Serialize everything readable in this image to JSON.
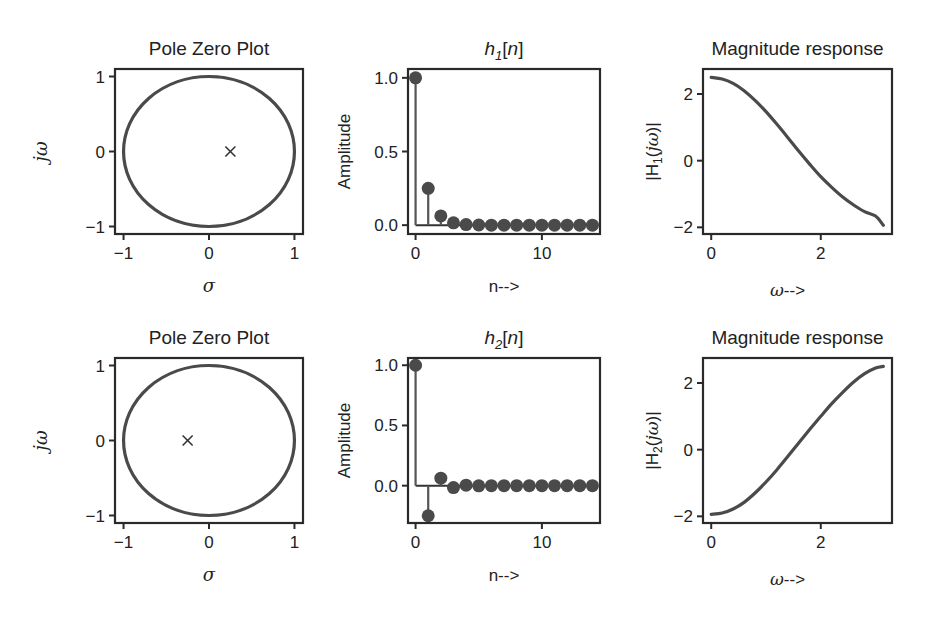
{
  "figure": {
    "width": 934,
    "height": 617,
    "line_color": "#4a4a4a",
    "frame_color": "#2a2a2a"
  },
  "chart_data": [
    {
      "id": "pz1",
      "type": "scatter",
      "subtype": "pole-zero",
      "title": "Pole Zero Plot",
      "xlabel": "σ",
      "ylabel": "jω",
      "xlim": [
        -1.1,
        1.1
      ],
      "ylim": [
        -1.1,
        1.1
      ],
      "xticks": [
        -1,
        0,
        1
      ],
      "xticklabels": [
        "−1",
        "0",
        "1"
      ],
      "yticks": [
        -1,
        0,
        1
      ],
      "yticklabels": [
        "−1",
        "0",
        "1"
      ],
      "unit_circle": true,
      "poles": [
        [
          0.25,
          0
        ]
      ],
      "zeros": [],
      "grid": false
    },
    {
      "id": "h1",
      "type": "stem",
      "title_main": "h",
      "title_sub": "1",
      "title_rest": "[n]",
      "title": "h1[n]",
      "xlabel": "n-->",
      "ylabel": "Amplitude",
      "xlim": [
        -0.6,
        14.6
      ],
      "ylim": [
        -0.06,
        1.06
      ],
      "xticks": [
        0,
        10
      ],
      "xticklabels": [
        "0",
        "10"
      ],
      "yticks": [
        0.0,
        0.5,
        1.0
      ],
      "yticklabels": [
        "0.0",
        "0.5",
        "1.0"
      ],
      "x": [
        0,
        1,
        2,
        3,
        4,
        5,
        6,
        7,
        8,
        9,
        10,
        11,
        12,
        13,
        14
      ],
      "values": [
        1.0,
        0.25,
        0.0625,
        0.0156,
        0.0039,
        0.001,
        0.0002,
        0.0001,
        0,
        0,
        0,
        0,
        0,
        0,
        0
      ],
      "grid": false
    },
    {
      "id": "mag1",
      "type": "line",
      "title": "Magnitude response",
      "xlabel": "ω-->",
      "ylabel_pre": "|H",
      "ylabel_sub": "1",
      "ylabel_post": "(jω)|",
      "ylabel": "|H1(jω)|",
      "xlim": [
        -0.15,
        3.3
      ],
      "ylim": [
        -2.2,
        2.75
      ],
      "xticks": [
        0,
        2
      ],
      "xticklabels": [
        "0",
        "2"
      ],
      "yticks": [
        -2,
        0,
        2
      ],
      "yticklabels": [
        "−2",
        "0",
        "2"
      ],
      "x": [
        0.0,
        0.2,
        0.4,
        0.6,
        0.8,
        1.0,
        1.2,
        1.4,
        1.6,
        1.8,
        2.0,
        2.2,
        2.4,
        2.6,
        2.8,
        3.0,
        3.1416
      ],
      "values": [
        2.5,
        2.45,
        2.32,
        2.1,
        1.81,
        1.47,
        1.09,
        0.69,
        0.28,
        -0.11,
        -0.48,
        -0.8,
        -1.09,
        -1.33,
        -1.53,
        -1.66,
        -1.94
      ],
      "grid": false
    },
    {
      "id": "pz2",
      "type": "scatter",
      "subtype": "pole-zero",
      "title": "Pole Zero Plot",
      "xlabel": "σ",
      "ylabel": "jω",
      "xlim": [
        -1.1,
        1.1
      ],
      "ylim": [
        -1.1,
        1.1
      ],
      "xticks": [
        -1,
        0,
        1
      ],
      "xticklabels": [
        "−1",
        "0",
        "1"
      ],
      "yticks": [
        -1,
        0,
        1
      ],
      "yticklabels": [
        "−1",
        "0",
        "1"
      ],
      "unit_circle": true,
      "poles": [
        [
          -0.25,
          0
        ]
      ],
      "zeros": [],
      "grid": false
    },
    {
      "id": "h2",
      "type": "stem",
      "title_main": "h",
      "title_sub": "2",
      "title_rest": "[n]",
      "title": "h2[n]",
      "xlabel": "n-->",
      "ylabel": "Amplitude",
      "xlim": [
        -0.6,
        14.6
      ],
      "ylim": [
        -0.31,
        1.06
      ],
      "xticks": [
        0,
        10
      ],
      "xticklabels": [
        "0",
        "10"
      ],
      "yticks": [
        0.0,
        0.5,
        1.0
      ],
      "yticklabels": [
        "0.0",
        "0.5",
        "1.0"
      ],
      "x": [
        0,
        1,
        2,
        3,
        4,
        5,
        6,
        7,
        8,
        9,
        10,
        11,
        12,
        13,
        14
      ],
      "values": [
        1.0,
        -0.25,
        0.0625,
        -0.0156,
        0.0039,
        -0.001,
        0.0002,
        -0.0001,
        0,
        0,
        0,
        0,
        0,
        0,
        0
      ],
      "grid": false
    },
    {
      "id": "mag2",
      "type": "line",
      "title": "Magnitude response",
      "xlabel": "ω-->",
      "ylabel_pre": "|H",
      "ylabel_sub": "2",
      "ylabel_post": "(jω)|",
      "ylabel": "|H2(jω)|",
      "xlim": [
        -0.15,
        3.3
      ],
      "ylim": [
        -2.2,
        2.75
      ],
      "xticks": [
        0,
        2
      ],
      "xticklabels": [
        "0",
        "2"
      ],
      "yticks": [
        -2,
        0,
        2
      ],
      "yticklabels": [
        "−2",
        "0",
        "2"
      ],
      "x": [
        0.0,
        0.2,
        0.4,
        0.6,
        0.8,
        1.0,
        1.2,
        1.4,
        1.6,
        1.8,
        2.0,
        2.2,
        2.4,
        2.6,
        2.8,
        3.0,
        3.1416
      ],
      "values": [
        -1.94,
        -1.9,
        -1.78,
        -1.58,
        -1.3,
        -0.97,
        -0.6,
        -0.2,
        0.21,
        0.61,
        1.0,
        1.38,
        1.72,
        2.03,
        2.28,
        2.45,
        2.5
      ],
      "grid": false
    }
  ]
}
